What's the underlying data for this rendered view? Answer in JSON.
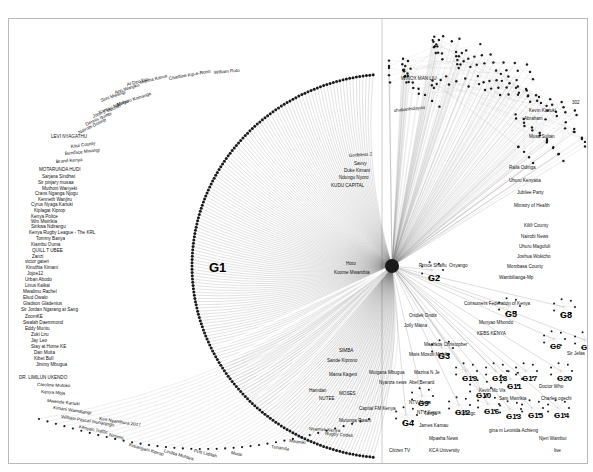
{
  "figure": {
    "type": "network-graph",
    "title": "",
    "background_color": "#ffffff",
    "border_color": "#b9b9b9",
    "edge_color": "#555555",
    "node_color": "#222222"
  },
  "group_labels": [
    {
      "id": "G1",
      "text": "G1",
      "x": 200,
      "y": 242,
      "size": 13
    },
    {
      "id": "G2",
      "text": "G2",
      "x": 419,
      "y": 255,
      "size": 9
    },
    {
      "id": "G3",
      "text": "G3",
      "x": 429,
      "y": 333,
      "size": 9
    },
    {
      "id": "G4",
      "text": "G4",
      "x": 393,
      "y": 400,
      "size": 9
    },
    {
      "id": "G5",
      "text": "G5",
      "x": 496,
      "y": 291,
      "size": 9
    },
    {
      "id": "G6",
      "text": "G6",
      "x": 541,
      "y": 324,
      "size": 8
    },
    {
      "id": "G7",
      "text": "G7",
      "x": 572,
      "y": 325,
      "size": 8
    },
    {
      "id": "G8",
      "text": "G8",
      "x": 551,
      "y": 292,
      "size": 9
    },
    {
      "id": "G9",
      "text": "G9",
      "x": 409,
      "y": 381,
      "size": 8
    },
    {
      "id": "G10",
      "text": "G10",
      "x": 467,
      "y": 373,
      "size": 8
    },
    {
      "id": "G11",
      "text": "G11",
      "x": 498,
      "y": 364,
      "size": 8
    },
    {
      "id": "G12",
      "text": "G12",
      "x": 446,
      "y": 390,
      "size": 8
    },
    {
      "id": "G13",
      "text": "G13",
      "x": 497,
      "y": 394,
      "size": 8
    },
    {
      "id": "G14",
      "text": "G14",
      "x": 545,
      "y": 393,
      "size": 8
    },
    {
      "id": "G15",
      "text": "G15",
      "x": 519,
      "y": 393,
      "size": 8
    },
    {
      "id": "G16",
      "text": "G16",
      "x": 475,
      "y": 389,
      "size": 8
    },
    {
      "id": "G17",
      "text": "G17",
      "x": 513,
      "y": 356,
      "size": 8
    },
    {
      "id": "G18",
      "text": "G18",
      "x": 483,
      "y": 356,
      "size": 8
    },
    {
      "id": "G19",
      "text": "G19",
      "x": 453,
      "y": 356,
      "size": 8
    },
    {
      "id": "G20",
      "text": "G20",
      "x": 548,
      "y": 356,
      "size": 8
    }
  ],
  "node_labels": [
    {
      "text": "Martha Karua",
      "x": 131,
      "y": 62,
      "rot": -14
    },
    {
      "text": "AI Dec Dic",
      "x": 118,
      "y": 64,
      "rot": -14
    },
    {
      "text": "Chiefline Kip-e-Rono",
      "x": 160,
      "y": 58,
      "rot": -10
    },
    {
      "text": "William Ruto",
      "x": 205,
      "y": 52,
      "rot": -5
    },
    {
      "text": "Ann Wanjiku",
      "x": 106,
      "y": 72,
      "rot": -18
    },
    {
      "text": "Simi Mwangi",
      "x": 92,
      "y": 80,
      "rot": -20
    },
    {
      "text": "Muhoro Koinange",
      "x": 108,
      "y": 84,
      "rot": -18
    },
    {
      "text": "Kamau Ndungu",
      "x": 90,
      "y": 92,
      "rot": -22
    },
    {
      "text": "John J Muchiri",
      "x": 84,
      "y": 96,
      "rot": -22
    },
    {
      "text": "Dennis Itumbi",
      "x": 77,
      "y": 104,
      "rot": -24
    },
    {
      "text": "Nairobi Gossip",
      "x": 70,
      "y": 112,
      "rot": -26
    },
    {
      "text": "LEVI NYAGATHU",
      "x": 42,
      "y": 116,
      "rot": 0
    },
    {
      "text": "Kitui County",
      "x": 62,
      "y": 126,
      "rot": -8
    },
    {
      "text": "Boniface Mwangi",
      "x": 56,
      "y": 133,
      "rot": -6
    },
    {
      "text": "Brand Kenya",
      "x": 47,
      "y": 141,
      "rot": -4
    },
    {
      "text": "MOTARUNDA HUDI",
      "x": 30,
      "y": 149,
      "rot": 0
    },
    {
      "text": "Sarjana Sindhwi",
      "x": 33,
      "y": 156,
      "rot": 0
    },
    {
      "text": "Sir pinjary musaa",
      "x": 29,
      "y": 162,
      "rot": 0
    },
    {
      "text": "Muthoni Wanyeki",
      "x": 33,
      "y": 168,
      "rot": 0
    },
    {
      "text": "Crans Nganga Njogu",
      "x": 26,
      "y": 173,
      "rot": 0
    },
    {
      "text": "Kenneth Wanjiru",
      "x": 29,
      "y": 179,
      "rot": 0
    },
    {
      "text": "Cyrus Nyaga Kariuki",
      "x": 22,
      "y": 184,
      "rot": 0
    },
    {
      "text": "Kiplagat Kiprop",
      "x": 25,
      "y": 190,
      "rot": 0
    },
    {
      "text": "Kenya Police",
      "x": 22,
      "y": 196,
      "rot": 0
    },
    {
      "text": "Wm Mwirikia",
      "x": 22,
      "y": 201,
      "rot": 0
    },
    {
      "text": "Sirikwa Ndirangu",
      "x": 22,
      "y": 206,
      "rot": 0
    },
    {
      "text": "Kenya Rugby League - The KRL",
      "x": 20,
      "y": 212,
      "rot": 0
    },
    {
      "text": "Tommy Banya",
      "x": 27,
      "y": 218,
      "rot": 0
    },
    {
      "text": "Kiambu Ouma",
      "x": 22,
      "y": 224,
      "rot": 0
    },
    {
      "text": "QUILL T UBEE",
      "x": 23,
      "y": 230,
      "rot": 0
    },
    {
      "text": "Zanzi",
      "x": 23,
      "y": 236,
      "rot": 0
    },
    {
      "text": "victor gateri",
      "x": 16,
      "y": 241,
      "rot": 0
    },
    {
      "text": "Kinuthia Kimani",
      "x": 17,
      "y": 247,
      "rot": 0
    },
    {
      "text": "Jojoe12",
      "x": 18,
      "y": 253,
      "rot": 0
    },
    {
      "text": "Urban Abodo",
      "x": 16,
      "y": 259,
      "rot": 0
    },
    {
      "text": "Linus Kaikai",
      "x": 16,
      "y": 265,
      "rot": 0
    },
    {
      "text": "Mwalimu Rachel",
      "x": 14,
      "y": 271,
      "rot": 0
    },
    {
      "text": "Eliud Owalo",
      "x": 14,
      "y": 277,
      "rot": 0
    },
    {
      "text": "Gladson Gladenius",
      "x": 14,
      "y": 283,
      "rot": 0
    },
    {
      "text": "Sir Jordan Ngarang at Sang",
      "x": 12,
      "y": 289,
      "rot": 0
    },
    {
      "text": "ZoomKE",
      "x": 16,
      "y": 296,
      "rot": 0
    },
    {
      "text": "Swalah Daemmond",
      "x": 14,
      "y": 302,
      "rot": 0
    },
    {
      "text": "Eddy Muntu",
      "x": 16,
      "y": 308,
      "rot": 0
    },
    {
      "text": "Zuki Liru",
      "x": 22,
      "y": 314,
      "rot": 0
    },
    {
      "text": "Jay Leo",
      "x": 22,
      "y": 320,
      "rot": 0
    },
    {
      "text": "Stay at Home KE",
      "x": 22,
      "y": 326,
      "rot": 0
    },
    {
      "text": "Dan Muita",
      "x": 25,
      "y": 332,
      "rot": 0
    },
    {
      "text": "Kibet Bull",
      "x": 25,
      "y": 338,
      "rot": 0
    },
    {
      "text": "Jimmy Mbugua",
      "x": 27,
      "y": 344,
      "rot": 0
    },
    {
      "text": "DR. LIMILUN UKENDO",
      "x": 10,
      "y": 357,
      "rot": 0
    },
    {
      "text": "Caroline Mutoko",
      "x": 28,
      "y": 364,
      "rot": 2
    },
    {
      "text": "Kenya Moja",
      "x": 32,
      "y": 371,
      "rot": 4
    },
    {
      "text": "Mwende Kariuki",
      "x": 38,
      "y": 380,
      "rot": 6
    },
    {
      "text": "Kimani Wamatangi",
      "x": 44,
      "y": 387,
      "rot": 8
    },
    {
      "text": "William Pascal munanjogo",
      "x": 52,
      "y": 396,
      "rot": 9
    },
    {
      "text": "Ken Nyambura 2017",
      "x": 90,
      "y": 398,
      "rot": 9
    },
    {
      "text": "Kenyan Traffic",
      "x": 70,
      "y": 406,
      "rot": 12
    },
    {
      "text": "Nzomo",
      "x": 100,
      "y": 414,
      "rot": 14
    },
    {
      "text": "Kisiangani Kiprop",
      "x": 120,
      "y": 424,
      "rot": 16
    },
    {
      "text": "Lindsa Mutisya",
      "x": 155,
      "y": 430,
      "rot": 16
    },
    {
      "text": "Pritt Liddah",
      "x": 185,
      "y": 430,
      "rot": 14
    },
    {
      "text": "Mutai",
      "x": 222,
      "y": 432,
      "rot": 12
    },
    {
      "text": "Tunanda",
      "x": 262,
      "y": 426,
      "rot": 8
    },
    {
      "text": "Mwaniki",
      "x": 280,
      "y": 420,
      "rot": 8
    },
    {
      "text": "Rugby Codes",
      "x": 316,
      "y": 413,
      "rot": 4
    },
    {
      "text": "Nyamira Kenya",
      "x": 300,
      "y": 408,
      "rot": 4
    },
    {
      "text": "Mutunga Pwani",
      "x": 330,
      "y": 400,
      "rot": 0
    },
    {
      "text": "MOSES",
      "x": 330,
      "y": 373,
      "rot": 0
    },
    {
      "text": "NUTEE",
      "x": 310,
      "y": 378,
      "rot": 0
    },
    {
      "text": "Hamdan",
      "x": 300,
      "y": 370,
      "rot": 0
    },
    {
      "text": "Maina Kageni",
      "x": 320,
      "y": 354,
      "rot": 0
    },
    {
      "text": "Sande Kiprono",
      "x": 318,
      "y": 340,
      "rot": 0
    },
    {
      "text": "SIMBA",
      "x": 330,
      "y": 330,
      "rot": 0
    },
    {
      "text": "Koome Mwambia",
      "x": 325,
      "y": 252,
      "rot": 0
    },
    {
      "text": "Hoto",
      "x": 337,
      "y": 243,
      "rot": 0
    },
    {
      "text": "KUDU CAPITAL",
      "x": 322,
      "y": 165,
      "rot": 0
    },
    {
      "text": "Ndungu Nyoro",
      "x": 330,
      "y": 157,
      "rot": 0
    },
    {
      "text": "Duke Kimani",
      "x": 335,
      "y": 150,
      "rot": 0
    },
    {
      "text": "Savvy",
      "x": 345,
      "y": 143,
      "rot": 0
    },
    {
      "text": "Godbless 2",
      "x": 340,
      "y": 135,
      "rot": -4
    },
    {
      "text": "shabanhidayaa",
      "x": 385,
      "y": 90,
      "rot": -6
    },
    {
      "text": "WINOX MAN LIU",
      "x": 392,
      "y": 58,
      "rot": 0
    },
    {
      "text": "Ministry of Health",
      "x": 505,
      "y": 185,
      "rot": 0
    },
    {
      "text": "Jubilee Party",
      "x": 508,
      "y": 172,
      "rot": 0
    },
    {
      "text": "Uhuru Kenyatta",
      "x": 500,
      "y": 160,
      "rot": 0
    },
    {
      "text": "Raila Odinga",
      "x": 500,
      "y": 147,
      "rot": 0
    },
    {
      "text": "Abraham",
      "x": 515,
      "y": 98,
      "rot": 0
    },
    {
      "text": "Musa Sultan",
      "x": 520,
      "y": 116,
      "rot": 0
    },
    {
      "text": "Kevin Kariuki",
      "x": 520,
      "y": 90,
      "rot": 0
    },
    {
      "text": "302",
      "x": 563,
      "y": 82,
      "rot": 0
    },
    {
      "text": "Kilifi County",
      "x": 515,
      "y": 205,
      "rot": 0
    },
    {
      "text": "Nairobi News",
      "x": 512,
      "y": 216,
      "rot": 0
    },
    {
      "text": "Uhuru Magufuli",
      "x": 510,
      "y": 226,
      "rot": 0
    },
    {
      "text": "Joshua Wokicho",
      "x": 508,
      "y": 236,
      "rot": 0
    },
    {
      "text": "Mombasa County",
      "x": 498,
      "y": 246,
      "rot": 0
    },
    {
      "text": "Wambilianga-Mp",
      "x": 490,
      "y": 257,
      "rot": 0
    },
    {
      "text": "Consumers Federation of Kenya",
      "x": 455,
      "y": 283,
      "rot": 0
    },
    {
      "text": "Munyao Mbondo",
      "x": 470,
      "y": 302,
      "rot": 0
    },
    {
      "text": "KEBS KENYA",
      "x": 468,
      "y": 313,
      "rot": 0
    },
    {
      "text": "Sir Jefas",
      "x": 558,
      "y": 333,
      "rot": 0
    },
    {
      "text": "Doctor Who",
      "x": 530,
      "y": 366,
      "rot": 0
    },
    {
      "text": "Charles ogechi",
      "x": 532,
      "y": 378,
      "rot": 0
    },
    {
      "text": "Sam Mwirikia",
      "x": 490,
      "y": 378,
      "rot": 0
    },
    {
      "text": "Kevin Mc Vis",
      "x": 470,
      "y": 370,
      "rot": 0
    },
    {
      "text": "Kipkngc",
      "x": 450,
      "y": 393,
      "rot": 0
    },
    {
      "text": "Tanga",
      "x": 415,
      "y": 393,
      "rot": 0
    },
    {
      "text": "gina m Leonida Achieng",
      "x": 480,
      "y": 410,
      "rot": 0
    },
    {
      "text": "Mpasha News",
      "x": 420,
      "y": 418,
      "rot": 0
    },
    {
      "text": "James Kamau",
      "x": 410,
      "y": 405,
      "rot": 0
    },
    {
      "text": "Citizen TV",
      "x": 380,
      "y": 430,
      "rot": 0
    },
    {
      "text": "KCA University",
      "x": 420,
      "y": 430,
      "rot": 0
    },
    {
      "text": "Capital FM Kenya",
      "x": 350,
      "y": 388,
      "rot": 0
    },
    {
      "text": "NTV News",
      "x": 400,
      "y": 382,
      "rot": 0
    },
    {
      "text": "NTV Kenya",
      "x": 408,
      "y": 392,
      "rot": 0
    },
    {
      "text": "Nyanza news",
      "x": 370,
      "y": 362,
      "rot": 0
    },
    {
      "text": "Abel Benard",
      "x": 400,
      "y": 362,
      "rot": 0
    },
    {
      "text": "Muigana Mbugua",
      "x": 360,
      "y": 352,
      "rot": 0
    },
    {
      "text": "Mazina N Je",
      "x": 405,
      "y": 352,
      "rot": 0
    },
    {
      "text": "Machkos Christopher",
      "x": 415,
      "y": 324,
      "rot": 0
    },
    {
      "text": "Mwis Mosoti Mobile",
      "x": 400,
      "y": 334,
      "rot": 0
    },
    {
      "text": "Jolly Maina",
      "x": 395,
      "y": 305,
      "rot": 0
    },
    {
      "text": "Ondiek Ondis",
      "x": 400,
      "y": 295,
      "rot": 0
    },
    {
      "text": "Prince Shaffu",
      "x": 410,
      "y": 245,
      "rot": 0
    },
    {
      "text": "Onyango",
      "x": 440,
      "y": 245,
      "rot": 0
    },
    {
      "text": "live",
      "x": 545,
      "y": 430,
      "rot": 0
    },
    {
      "text": "Njeri Wambui",
      "x": 530,
      "y": 418,
      "rot": 0
    }
  ]
}
